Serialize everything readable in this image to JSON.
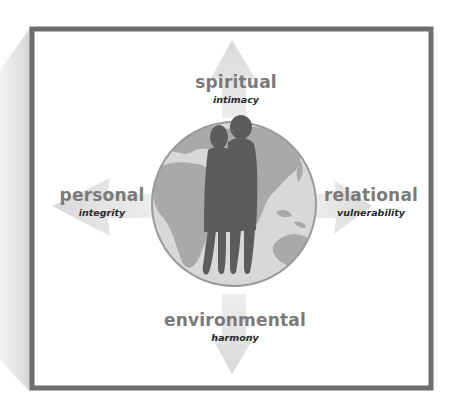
{
  "diagram": {
    "type": "concept-diagram",
    "center": {
      "image": "globe-with-couple-silhouette",
      "description": "Globe showing Africa, Europe, Asia and Australia with a couple silhouette in front"
    },
    "dimensions": [
      {
        "id": "top",
        "title": "spiritual",
        "subtitle": "intimacy",
        "direction": "up"
      },
      {
        "id": "left",
        "title": "personal",
        "subtitle": "integrity",
        "direction": "left"
      },
      {
        "id": "right",
        "title": "relational",
        "subtitle": "vulnerability",
        "direction": "right"
      },
      {
        "id": "bottom",
        "title": "environmental",
        "subtitle": "harmony",
        "direction": "down"
      }
    ]
  },
  "colors": {
    "frame": "#6e6e6e",
    "shadow": "#dcdcdc",
    "arrow": "#e2e2e2",
    "ocean": "#d8d8d8",
    "land": "#a9a9a9",
    "globe_rim": "#9a9a9a",
    "silhouette": "#5c5c5c",
    "title_text": "#7a7a7a",
    "subtitle_text": "#2a2a2a"
  }
}
